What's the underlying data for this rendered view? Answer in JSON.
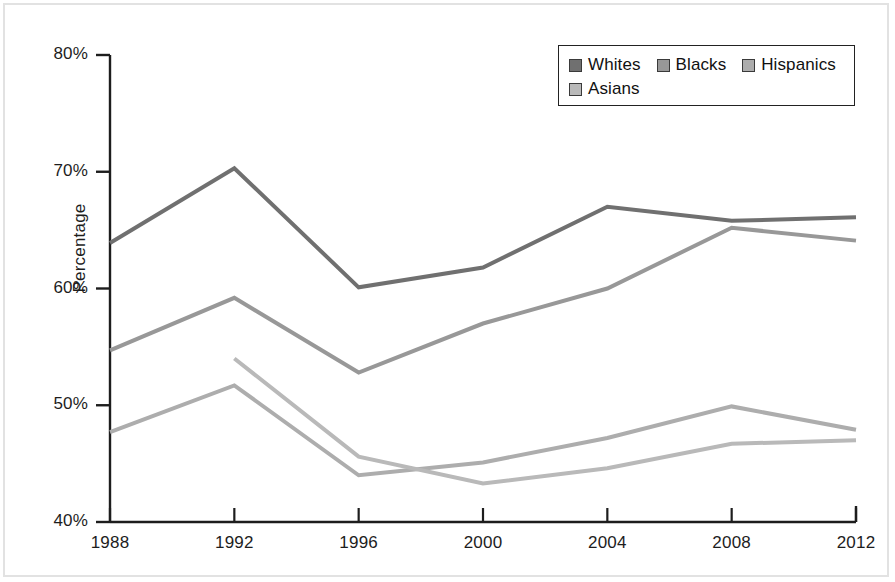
{
  "chart_data": {
    "type": "line",
    "title": "",
    "xlabel": "",
    "ylabel": "Percentage",
    "x": [
      1988,
      1992,
      1996,
      2000,
      2004,
      2008,
      2012
    ],
    "categories": [
      "1988",
      "1992",
      "1996",
      "2000",
      "2004",
      "2008",
      "2012"
    ],
    "xlim": [
      1988,
      2012
    ],
    "ylim": [
      40,
      80
    ],
    "yticks": [
      40,
      50,
      60,
      70,
      80
    ],
    "ytick_labels": [
      "40%",
      "50%",
      "60%",
      "70%",
      "80%"
    ],
    "grid": false,
    "legend_position": "top-right",
    "series": [
      {
        "name": "Whites",
        "color": "#707070",
        "values": [
          63.9,
          70.3,
          60.1,
          61.8,
          67.0,
          65.8,
          66.1
        ]
      },
      {
        "name": "Blacks",
        "color": "#989898",
        "values": [
          54.7,
          59.2,
          52.8,
          57.0,
          60.0,
          65.2,
          64.1
        ]
      },
      {
        "name": "Hispanics",
        "color": "#adadad",
        "values": [
          47.7,
          51.7,
          44.0,
          45.1,
          47.2,
          49.9,
          47.9
        ]
      },
      {
        "name": "Asians",
        "color": "#b9b9b9",
        "values": [
          null,
          54.0,
          45.6,
          43.3,
          44.6,
          46.7,
          47.0
        ]
      }
    ]
  },
  "axis": {
    "y_title": "Percentage"
  },
  "legend": {
    "items": [
      {
        "label": "Whites",
        "swatch": "#707070"
      },
      {
        "label": "Blacks",
        "swatch": "#989898"
      },
      {
        "label": "Hispanics",
        "swatch": "#adadad"
      },
      {
        "label": "Asians",
        "swatch": "#b9b9b9"
      }
    ]
  }
}
